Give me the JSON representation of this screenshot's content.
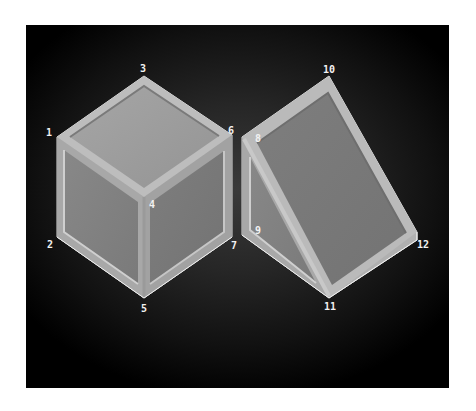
{
  "diagram": {
    "title": "",
    "shapes": [
      {
        "name": "cube",
        "vertices": [
          {
            "id": "1",
            "label": "1"
          },
          {
            "id": "2",
            "label": "2"
          },
          {
            "id": "3",
            "label": "3"
          },
          {
            "id": "4",
            "label": "4"
          },
          {
            "id": "5",
            "label": "5"
          },
          {
            "id": "6",
            "label": "6"
          },
          {
            "id": "7",
            "label": "7"
          }
        ]
      },
      {
        "name": "triangular-prism",
        "vertices": [
          {
            "id": "8",
            "label": "8"
          },
          {
            "id": "9",
            "label": "9"
          },
          {
            "id": "10",
            "label": "10"
          },
          {
            "id": "11",
            "label": "11"
          },
          {
            "id": "12",
            "label": "12"
          }
        ]
      }
    ],
    "colors": {
      "background": "#000000",
      "face_top": "#9a9a9a",
      "face_side": "#7c7c7c",
      "frame_edge": "#b8b8b8",
      "label": "#f2f2f2"
    }
  }
}
